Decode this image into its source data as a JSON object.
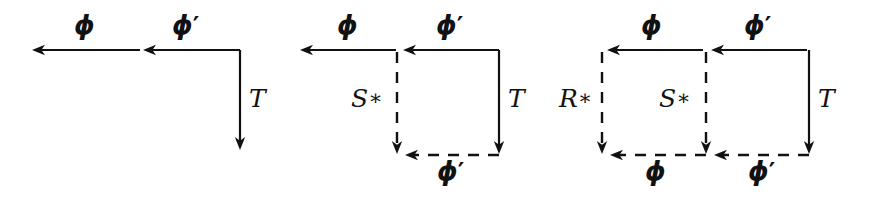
{
  "figure": {
    "canvas": {
      "width": 873,
      "height": 200
    },
    "ink_color": "#111111",
    "background_color": "#ffffff",
    "symbols": {
      "phi": "ϕ",
      "phi_prime": "ϕ′",
      "T": "T",
      "S_star": "S∗",
      "R_star": "R∗"
    }
  },
  "diagrams": [
    {
      "id": "diagram-1",
      "name": "single-arrow-corner",
      "labels": [
        {
          "name": "label-phi-top-left",
          "text": "ϕ",
          "x": 74,
          "y": 12,
          "kind": "phi"
        },
        {
          "name": "label-phi-prime-top",
          "text": "ϕ′",
          "x": 172,
          "y": 12,
          "kind": "phi"
        },
        {
          "name": "label-T-right",
          "text": "T",
          "x": 249,
          "y": 86,
          "kind": "roman"
        }
      ],
      "arrows": [
        {
          "name": "arrow-phi-top-left",
          "style": "solid",
          "dir": "left",
          "x1": 140,
          "y1": 50,
          "x2": 32,
          "y2": 50
        },
        {
          "name": "arrow-phi-prime-top",
          "style": "solid",
          "dir": "left",
          "x1": 240,
          "y1": 50,
          "x2": 143,
          "y2": 50
        },
        {
          "name": "arrow-T-right",
          "style": "solid",
          "dir": "down",
          "x1": 240,
          "y1": 50,
          "x2": 240,
          "y2": 150
        }
      ]
    },
    {
      "id": "diagram-2",
      "name": "one-square-diagram",
      "labels": [
        {
          "name": "label-phi-top-left",
          "text": "ϕ",
          "x": 337,
          "y": 12,
          "kind": "phi"
        },
        {
          "name": "label-phi-prime-top",
          "text": "ϕ′",
          "x": 436,
          "y": 12,
          "kind": "phi"
        },
        {
          "name": "label-S-star-middle",
          "text": "S∗",
          "x": 351,
          "y": 86,
          "kind": "roman"
        },
        {
          "name": "label-T-right",
          "text": "T",
          "x": 508,
          "y": 86,
          "kind": "roman"
        },
        {
          "name": "label-phi-prime-bottom",
          "text": "ϕ′",
          "x": 437,
          "y": 158,
          "kind": "phi"
        }
      ],
      "arrows": [
        {
          "name": "arrow-phi-top-left",
          "style": "solid",
          "dir": "left",
          "x1": 396,
          "y1": 50,
          "x2": 300,
          "y2": 50
        },
        {
          "name": "arrow-phi-prime-top",
          "style": "solid",
          "dir": "left",
          "x1": 499,
          "y1": 50,
          "x2": 403,
          "y2": 50
        },
        {
          "name": "arrow-S-star-vertical",
          "style": "dashed",
          "dir": "down",
          "x1": 397,
          "y1": 52,
          "x2": 397,
          "y2": 154
        },
        {
          "name": "arrow-T-vertical",
          "style": "solid",
          "dir": "down",
          "x1": 499,
          "y1": 50,
          "x2": 499,
          "y2": 154
        },
        {
          "name": "arrow-phi-prime-bottom",
          "style": "dashed",
          "dir": "left",
          "x1": 499,
          "y1": 155,
          "x2": 405,
          "y2": 155
        }
      ]
    },
    {
      "id": "diagram-3",
      "name": "two-square-diagram",
      "labels": [
        {
          "name": "label-phi-top-left",
          "text": "ϕ",
          "x": 641,
          "y": 12,
          "kind": "phi"
        },
        {
          "name": "label-phi-prime-top",
          "text": "ϕ′",
          "x": 744,
          "y": 12,
          "kind": "phi"
        },
        {
          "name": "label-R-star-left",
          "text": "R∗",
          "x": 559,
          "y": 86,
          "kind": "roman"
        },
        {
          "name": "label-S-star-middle",
          "text": "S∗",
          "x": 659,
          "y": 86,
          "kind": "roman"
        },
        {
          "name": "label-T-right",
          "text": "T",
          "x": 818,
          "y": 86,
          "kind": "roman"
        },
        {
          "name": "label-phi-bottom-left",
          "text": "ϕ",
          "x": 645,
          "y": 158,
          "kind": "phi"
        },
        {
          "name": "label-phi-prime-bottom",
          "text": "ϕ′",
          "x": 748,
          "y": 158,
          "kind": "phi"
        }
      ],
      "arrows": [
        {
          "name": "arrow-phi-top-left",
          "style": "solid",
          "dir": "left",
          "x1": 703,
          "y1": 50,
          "x2": 607,
          "y2": 50
        },
        {
          "name": "arrow-phi-prime-top",
          "style": "solid",
          "dir": "left",
          "x1": 807,
          "y1": 50,
          "x2": 711,
          "y2": 50
        },
        {
          "name": "arrow-R-star-vertical",
          "style": "dashed",
          "dir": "down",
          "x1": 602,
          "y1": 52,
          "x2": 602,
          "y2": 154
        },
        {
          "name": "arrow-S-star-vertical",
          "style": "dashed",
          "dir": "down",
          "x1": 706,
          "y1": 52,
          "x2": 706,
          "y2": 154
        },
        {
          "name": "arrow-T-vertical",
          "style": "solid",
          "dir": "down",
          "x1": 809,
          "y1": 50,
          "x2": 809,
          "y2": 154
        },
        {
          "name": "arrow-phi-bottom-left",
          "style": "dashed",
          "dir": "left",
          "x1": 706,
          "y1": 155,
          "x2": 610,
          "y2": 155
        },
        {
          "name": "arrow-phi-prime-bottom",
          "style": "dashed",
          "dir": "left",
          "x1": 809,
          "y1": 155,
          "x2": 714,
          "y2": 155
        }
      ]
    }
  ]
}
